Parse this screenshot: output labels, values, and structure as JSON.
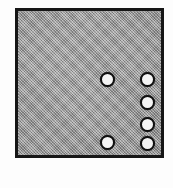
{
  "figure": {
    "canvas": {
      "width": 173,
      "height": 188
    },
    "background_color": "#fdfdfd"
  },
  "part": {
    "label": "part-body",
    "shape": "rectangle",
    "fill_style": "halftone-gray",
    "fill_color": "#9c9c9c",
    "border_color": "#161616",
    "border_width": 3,
    "x": 15,
    "y": 8,
    "width": 149,
    "height": 150
  },
  "holes": {
    "count": 6,
    "fill_color": "#f4f4f4",
    "ring_color": "#101010",
    "ring_width": 2,
    "diameter": 15,
    "items": [
      {
        "id": "hole-1",
        "column": "left",
        "cx": 107,
        "cy": 79
      },
      {
        "id": "hole-2",
        "column": "right",
        "cx": 147,
        "cy": 79
      },
      {
        "id": "hole-3",
        "column": "right",
        "cx": 147,
        "cy": 102
      },
      {
        "id": "hole-4",
        "column": "right",
        "cx": 147,
        "cy": 124
      },
      {
        "id": "hole-5",
        "column": "right",
        "cx": 147,
        "cy": 143
      },
      {
        "id": "hole-6",
        "column": "left",
        "cx": 107,
        "cy": 142
      }
    ]
  }
}
